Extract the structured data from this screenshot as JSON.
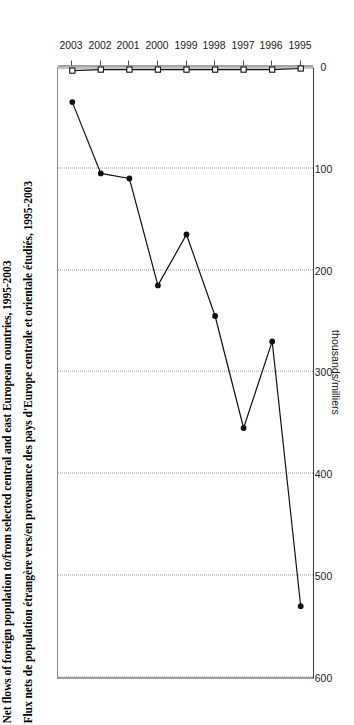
{
  "titles": {
    "en": "Net flows of foreign population to/from selected central and east European countries, 1995-2003",
    "fr": "Flux nets de population étrangère vers/en provenance des pays d'Europe centrale et orientale étudiés, 1995-2003"
  },
  "axis": {
    "y_title": "thousands/milliers",
    "y_ticks": [
      "0",
      "100",
      "200",
      "300",
      "400",
      "500",
      "600"
    ],
    "x_ticks": [
      "1995",
      "1996",
      "1997",
      "1998",
      "1999",
      "2000",
      "2001",
      "2002",
      "2003"
    ]
  },
  "legend": {
    "items": [
      {
        "label": "Russia/Féd. de Russie",
        "marker": "filled-circle-icon",
        "color": "#111111"
      },
      {
        "label": "Slovak Republic/Rép. slovaque",
        "marker": "open-square-icon",
        "color": "#111111"
      }
    ]
  },
  "chart_data": {
    "type": "line",
    "title": "Net flows of foreign population to/from selected central and east European countries, 1995-2003",
    "subtitle": "Flux nets de population étrangère vers/en provenance des pays d'Europe centrale et orientale étudiés, 1995-2003",
    "orientation": "rotated-90-ccw",
    "xlabel": "",
    "ylabel": "thousands/milliers",
    "x": [
      "1995",
      "1996",
      "1997",
      "1998",
      "1999",
      "2000",
      "2001",
      "2002",
      "2003"
    ],
    "ylim": [
      0,
      600
    ],
    "yticks": [
      0,
      100,
      200,
      300,
      400,
      500,
      600
    ],
    "grid": true,
    "legend_position": "bottom",
    "series": [
      {
        "name": "Russia/Féd. de Russie",
        "marker": "filled-circle",
        "color": "#111111",
        "values": [
          530,
          270,
          355,
          245,
          165,
          215,
          110,
          105,
          35
        ]
      },
      {
        "name": "Slovak Republic/Rép. slovaque",
        "marker": "open-square",
        "color": "#111111",
        "values": [
          2,
          3,
          3,
          3,
          3,
          3,
          3,
          3,
          4
        ]
      }
    ]
  }
}
